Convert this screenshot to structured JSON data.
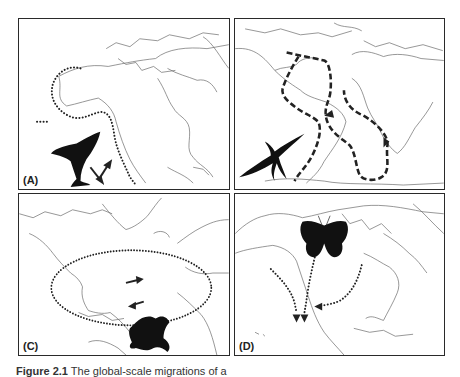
{
  "figure": {
    "panels": [
      {
        "id": "A",
        "label": "(A)",
        "animal": "humpback whale",
        "region": "North Pacific / western North America",
        "route_style": "dotted",
        "route_description": "Coastal route from Alaska down western North America to Mexico; arrows indicate two-way travel"
      },
      {
        "id": "B",
        "label": "",
        "animal": "Arctic tern (seabird)",
        "region": "Atlantic Ocean, Arctic to Antarctic",
        "route_style": "dashed",
        "route_description": "Loop: south along the African coast, return north along the South American coast"
      },
      {
        "id": "C",
        "label": "(C)",
        "animal": "loggerhead sea turtle",
        "region": "North Atlantic gyre",
        "route_style": "dotted",
        "route_description": "Clockwise elliptical loop across the North Atlantic; eastbound arrow above, westbound arrow below"
      },
      {
        "id": "D",
        "label": "(D)",
        "animal": "monarch butterfly",
        "region": "North America",
        "route_style": "dotted",
        "route_description": "Three converging routes heading south from Canada/USA to central Mexico"
      }
    ],
    "caption": {
      "number": "Figure 2.1",
      "text": "The global-scale migrations of a"
    }
  }
}
